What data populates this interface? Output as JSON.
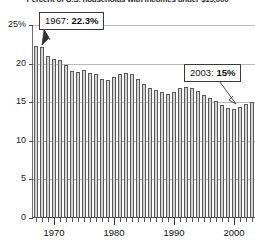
{
  "title_clipped": "Percent of U.S. households with incomes under $15,000",
  "chart_data": {
    "type": "bar",
    "title": "Percent of U.S. households with incomes under $15,000",
    "xlabel": "",
    "ylabel": "",
    "ylim": [
      0,
      25
    ],
    "grid": true,
    "legend": "none",
    "y_ticks": [
      "25%",
      "20",
      "15",
      "10",
      "5",
      "0"
    ],
    "y_tick_values": [
      25,
      20,
      15,
      10,
      5,
      0
    ],
    "x_tick_labels": [
      "1970",
      "1980",
      "1990",
      "2000"
    ],
    "x_tick_values": [
      1970,
      1980,
      1990,
      2000
    ],
    "categories": [
      1967,
      1968,
      1969,
      1970,
      1971,
      1972,
      1973,
      1974,
      1975,
      1976,
      1977,
      1978,
      1979,
      1980,
      1981,
      1982,
      1983,
      1984,
      1985,
      1986,
      1987,
      1988,
      1989,
      1990,
      1991,
      1992,
      1993,
      1994,
      1995,
      1996,
      1997,
      1998,
      1999,
      2000,
      2001,
      2002,
      2003
    ],
    "values": [
      22.3,
      22.2,
      21.0,
      20.6,
      20.5,
      19.8,
      19.0,
      18.9,
      19.2,
      18.8,
      18.6,
      18.0,
      17.9,
      18.3,
      18.6,
      18.8,
      18.6,
      18.0,
      17.4,
      16.9,
      16.6,
      16.3,
      16.0,
      16.3,
      16.8,
      17.0,
      16.9,
      16.4,
      15.9,
      15.6,
      15.2,
      14.7,
      14.3,
      14.1,
      14.4,
      14.8,
      15.0
    ],
    "annotations": [
      {
        "label": "1967: 22.3%",
        "year": 1967,
        "value": 22.3
      },
      {
        "label": "2003: 15%",
        "year": 2003,
        "value": 15
      }
    ]
  },
  "annotations": {
    "first": {
      "year": "1967:",
      "value": "22.3%"
    },
    "last": {
      "year": "2003:",
      "value": "15%"
    }
  }
}
